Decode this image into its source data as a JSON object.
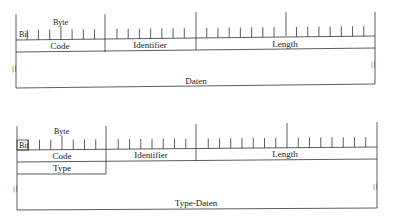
{
  "diagrams": [
    {
      "labels": {
        "bit": "Bit",
        "byte": "Byte",
        "code": "Code",
        "identifier": "Identifier",
        "length": "Length",
        "data": "Daten"
      }
    },
    {
      "labels": {
        "bit": "Bit",
        "byte": "Byte",
        "code": "Code",
        "identifier": "Identifier",
        "length": "Length",
        "type": "Type",
        "data": "Type-Daten"
      }
    }
  ],
  "break_mark": "//"
}
